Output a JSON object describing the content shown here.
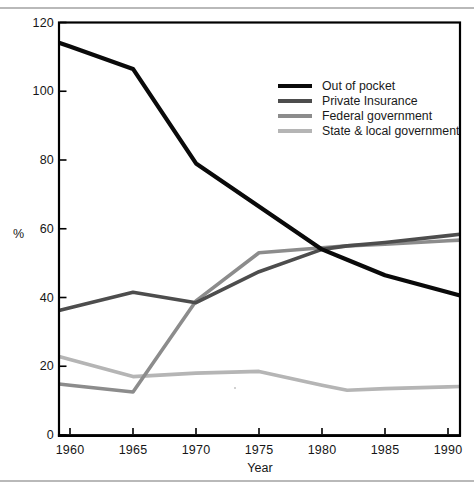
{
  "figure": {
    "ylabel": "%",
    "xlabel": "Year"
  },
  "chart_data": {
    "type": "line",
    "title": "",
    "xlabel": "Year",
    "ylabel": "%",
    "x": [
      1960,
      1965,
      1970,
      1975,
      1980,
      1982,
      1985,
      1990
    ],
    "series": [
      {
        "name": "Out of pocket",
        "color": "#0a0a0a",
        "stroke_width": 4.2,
        "values": [
          113,
          106.5,
          79,
          66.5,
          54,
          51,
          46.5,
          41.5
        ]
      },
      {
        "name": "Private Insurance",
        "color": "#4d4d4d",
        "stroke_width": 3.6,
        "values": [
          37,
          41.5,
          38.5,
          47.5,
          54,
          55,
          56,
          58
        ]
      },
      {
        "name": "Federal government",
        "color": "#8c8c8c",
        "stroke_width": 3.6,
        "values": [
          14.5,
          12.5,
          39,
          53,
          54.5,
          55,
          55.5,
          56.5
        ]
      },
      {
        "name": "State & local government",
        "color": "#b5b5b5",
        "stroke_width": 3.6,
        "values": [
          22,
          17,
          18,
          18.5,
          14.5,
          13,
          13.5,
          14
        ]
      }
    ],
    "x_ticks": [
      1960,
      1965,
      1970,
      1975,
      1980,
      1985,
      1990
    ],
    "y_ticks": [
      0,
      20,
      40,
      60,
      80,
      100,
      120
    ],
    "xlim": [
      1959.1,
      1991
    ],
    "ylim": [
      0,
      120
    ],
    "grid": false,
    "legend_position": "upper-right-inside",
    "frame_color": "#000000"
  }
}
